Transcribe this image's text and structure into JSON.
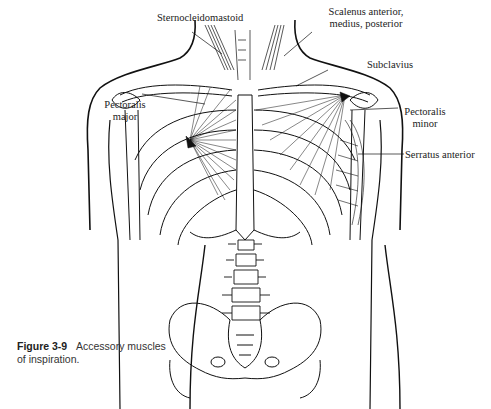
{
  "figure": {
    "number": "Figure 3-9",
    "caption": "Accessory muscles of inspiration.",
    "caption_line1": "Accessory muscles",
    "caption_line2": "of inspiration."
  },
  "labels": {
    "sternocleidomastoid": "Sternocleidomastoid",
    "scalenus_line1": "Scalenus anterior,",
    "scalenus_line2": "medius, posterior",
    "subclavius": "Subclavius",
    "pectoralis_major_line1": "Pectoralis",
    "pectoralis_major_line2": "major",
    "pectoralis_minor_line1": "Pectoralis",
    "pectoralis_minor_line2": "minor",
    "serratus_anterior": "Serratus anterior"
  }
}
